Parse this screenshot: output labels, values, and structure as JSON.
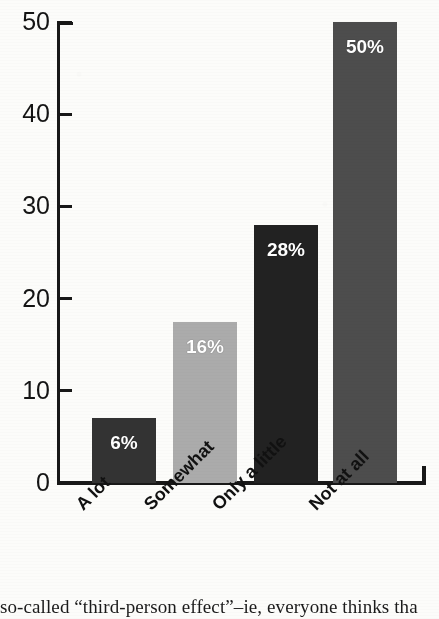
{
  "chart_data": {
    "type": "bar",
    "title": "",
    "subtitle": "",
    "xlabel": "",
    "ylabel": "",
    "categories": [
      "A lot",
      "Somewhat",
      "Only a little",
      "Not at all"
    ],
    "values": [
      7,
      17.5,
      28,
      50
    ],
    "data_labels": [
      "6%",
      "16%",
      "28%",
      "50%"
    ],
    "bar_colors": [
      "#333333",
      "#ababab",
      "#222222",
      "#4d4d4d"
    ],
    "ylim": [
      0,
      50
    ],
    "yticks": [
      0,
      10,
      20,
      30,
      40,
      50
    ],
    "ytick_labels": [
      "0",
      "10",
      "20",
      "30",
      "40",
      "50"
    ],
    "grid": false,
    "legend": "none",
    "axis_color": "#181818",
    "label_color": "#ffffff"
  },
  "caption": {
    "text": "so-called “third-person effect”–ie, everyone thinks tha"
  }
}
